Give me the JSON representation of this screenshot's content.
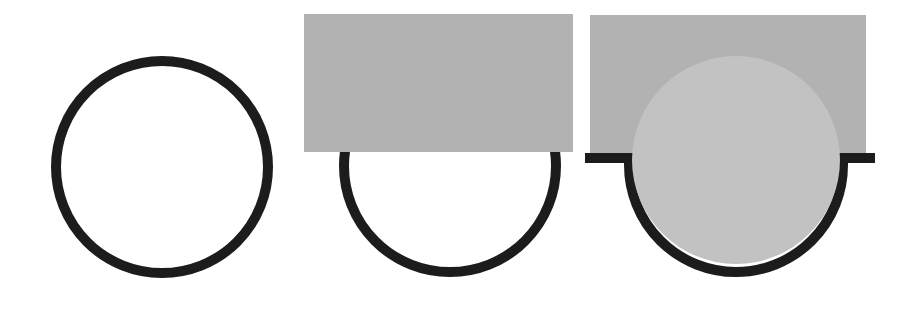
{
  "diagram": {
    "colors": {
      "background": "#ffffff",
      "stroke": "#1c1c1c",
      "rect_fill": "#b2b2b2",
      "disc_fill": "#c2c2c2"
    },
    "panels": [
      {
        "id": "panel-1",
        "shape": "circle-outline",
        "circle": {
          "cx": 162,
          "cy": 167,
          "r": 106,
          "stroke_width": 10
        }
      },
      {
        "id": "panel-2",
        "shape": "rect-over-circle",
        "rect": {
          "x": 304,
          "y": 14,
          "width": 269,
          "height": 138
        },
        "circle": {
          "cx": 450,
          "cy": 166,
          "r": 106,
          "stroke_width": 10
        }
      },
      {
        "id": "panel-3",
        "shape": "disc-in-cup",
        "rect": {
          "x": 590,
          "y": 15,
          "width": 276,
          "height": 139
        },
        "disc": {
          "cx": 736,
          "cy": 160,
          "r": 104
        },
        "cup": {
          "cx": 736,
          "cy": 165,
          "r": 107,
          "stroke_width": 10,
          "flange_left": 585,
          "flange_right": 875,
          "flange_y": 158
        }
      }
    ]
  }
}
